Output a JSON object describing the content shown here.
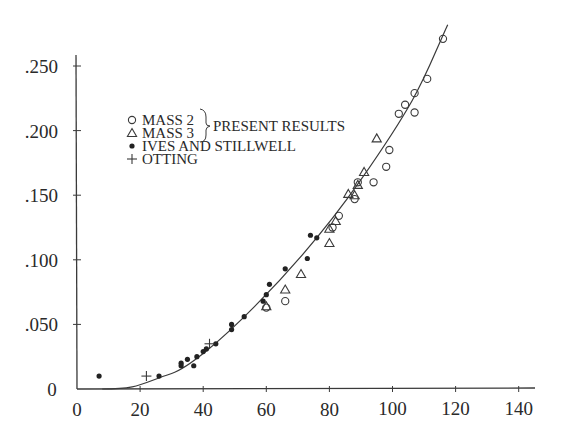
{
  "chart_data": {
    "type": "scatter",
    "title": "",
    "xlabel": "",
    "ylabel": "",
    "xlim": [
      0,
      145
    ],
    "ylim": [
      0,
      0.27
    ],
    "grid": false,
    "legend_position": "upper-left inside plot",
    "x_ticks": [
      "0",
      "20",
      "40",
      "60",
      "80",
      "100",
      "120",
      "140"
    ],
    "y_ticks": [
      "0",
      ".050",
      ".100",
      ".150",
      ".200",
      ".250"
    ],
    "legend": {
      "entries": [
        {
          "marker": "open-circle",
          "label": "MASS 2"
        },
        {
          "marker": "open-triangle",
          "label": "MASS 3"
        },
        {
          "marker": "filled-circle",
          "label": "IVES AND STILLWELL"
        },
        {
          "marker": "plus",
          "label": "OTTING"
        }
      ],
      "group_label": "PRESENT RESULTS"
    },
    "fit_curve": {
      "label": "theory curve",
      "points": [
        [
          10,
          0
        ],
        [
          20,
          0.005
        ],
        [
          30,
          0.012
        ],
        [
          40,
          0.027
        ],
        [
          50,
          0.046
        ],
        [
          60,
          0.066
        ],
        [
          70,
          0.094
        ],
        [
          80,
          0.124
        ],
        [
          90,
          0.162
        ],
        [
          100,
          0.203
        ],
        [
          110,
          0.245
        ],
        [
          117,
          0.28
        ]
      ]
    },
    "series": [
      {
        "name": "MASS 2",
        "marker": "open-circle",
        "points": [
          [
            66,
            0.068
          ],
          [
            60,
            0.063
          ],
          [
            81,
            0.125
          ],
          [
            83,
            0.134
          ],
          [
            88,
            0.147
          ],
          [
            89,
            0.16
          ],
          [
            94,
            0.16
          ],
          [
            98,
            0.172
          ],
          [
            99,
            0.185
          ],
          [
            102,
            0.213
          ],
          [
            104,
            0.22
          ],
          [
            107,
            0.229
          ],
          [
            107,
            0.214
          ],
          [
            111,
            0.24
          ],
          [
            116,
            0.271
          ]
        ]
      },
      {
        "name": "MASS 3",
        "marker": "open-triangle",
        "points": [
          [
            60,
            0.064
          ],
          [
            66,
            0.077
          ],
          [
            71,
            0.089
          ],
          [
            80,
            0.113
          ],
          [
            80,
            0.124
          ],
          [
            82,
            0.13
          ],
          [
            86,
            0.151
          ],
          [
            88,
            0.15
          ],
          [
            89,
            0.158
          ],
          [
            91,
            0.168
          ],
          [
            95,
            0.194
          ]
        ]
      },
      {
        "name": "IVES AND STILLWELL",
        "marker": "filled-circle",
        "points": [
          [
            7,
            0.01
          ],
          [
            26,
            0.01
          ],
          [
            33,
            0.02
          ],
          [
            33,
            0.018
          ],
          [
            35,
            0.023
          ],
          [
            37,
            0.018
          ],
          [
            38,
            0.025
          ],
          [
            40,
            0.029
          ],
          [
            41,
            0.031
          ],
          [
            44,
            0.035
          ],
          [
            49,
            0.046
          ],
          [
            49,
            0.05
          ],
          [
            53,
            0.056
          ],
          [
            59,
            0.068
          ],
          [
            60,
            0.073
          ],
          [
            61,
            0.081
          ],
          [
            66,
            0.093
          ],
          [
            73,
            0.101
          ],
          [
            74,
            0.119
          ],
          [
            76,
            0.117
          ]
        ]
      },
      {
        "name": "OTTING",
        "marker": "plus",
        "points": [
          [
            22,
            0.01
          ],
          [
            42,
            0.035
          ]
        ]
      }
    ]
  }
}
